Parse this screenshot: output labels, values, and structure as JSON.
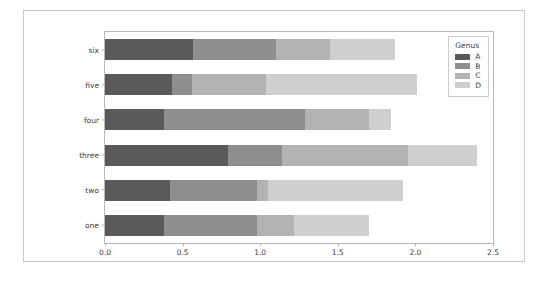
{
  "chart_data": {
    "type": "bar",
    "orientation": "horizontal",
    "stacked": true,
    "title": "",
    "xlabel": "",
    "ylabel": "",
    "xlim": [
      0.0,
      2.5
    ],
    "xticks": [
      "0.0",
      "0.5",
      "1.0",
      "1.5",
      "2.0",
      "2.5"
    ],
    "xtick_values": [
      0.0,
      0.5,
      1.0,
      1.5,
      2.0,
      2.5
    ],
    "grid": false,
    "categories": [
      "six",
      "five",
      "four",
      "three",
      "two",
      "one"
    ],
    "legend": {
      "title": "Genus",
      "position": "upper right",
      "entries": [
        {
          "label": "A",
          "color": "#5a5a5a"
        },
        {
          "label": "B",
          "color": "#8e8e8e"
        },
        {
          "label": "C",
          "color": "#b3b3b3"
        },
        {
          "label": "D",
          "color": "#cfcfcf"
        }
      ]
    },
    "series": [
      {
        "name": "A",
        "color": "#5a5a5a",
        "values": [
          0.57,
          0.43,
          0.38,
          0.79,
          0.42,
          0.38
        ]
      },
      {
        "name": "B",
        "color": "#8e8e8e",
        "values": [
          0.53,
          0.13,
          0.91,
          0.35,
          0.56,
          0.6
        ]
      },
      {
        "name": "C",
        "color": "#b3b3b3",
        "values": [
          0.35,
          0.48,
          0.41,
          0.81,
          0.07,
          0.24
        ]
      },
      {
        "name": "D",
        "color": "#cfcfcf",
        "values": [
          0.42,
          0.97,
          0.14,
          0.45,
          0.87,
          0.48
        ]
      }
    ],
    "totals": [
      1.87,
      2.01,
      1.84,
      2.4,
      1.92,
      1.7
    ],
    "cumulative": [
      [
        0.57,
        1.1,
        1.45,
        1.87
      ],
      [
        0.43,
        0.56,
        1.04,
        2.01
      ],
      [
        0.38,
        1.29,
        1.7,
        1.84
      ],
      [
        0.79,
        1.14,
        1.95,
        2.4
      ],
      [
        0.42,
        0.98,
        1.05,
        1.92
      ],
      [
        0.38,
        0.98,
        1.22,
        1.7
      ]
    ]
  },
  "figure": {
    "background": "#ffffff",
    "axes_background": "#ffffff",
    "border_color": "#c9c9c9"
  }
}
